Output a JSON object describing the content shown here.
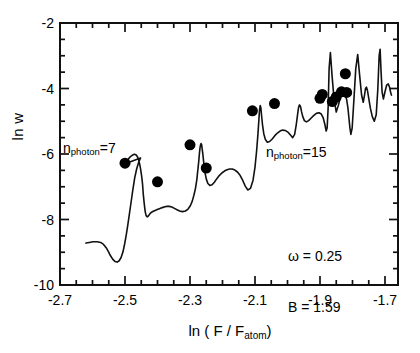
{
  "chart_data": {
    "type": "line",
    "title": "",
    "xlabel": "ln ( F / F_atom )",
    "ylabel": "ln w",
    "xlim": [
      -2.7,
      -1.66
    ],
    "ylim": [
      -10,
      -2
    ],
    "grid": false,
    "legend": "none",
    "xticks": [
      -2.7,
      -2.5,
      -2.3,
      -2.1,
      -1.9,
      -1.7
    ],
    "xtick_labels": [
      "-2.7",
      "-2.5",
      "-2.3",
      "-2.1",
      "-1.9",
      "-1.7"
    ],
    "xminor_step": 0.05,
    "yticks": [
      -2,
      -4,
      -6,
      -8,
      -10
    ],
    "ytick_labels": [
      "-2",
      "-4",
      "-6",
      "-8",
      "-10"
    ],
    "yminor_step": 0.5,
    "series": [
      {
        "name": "theory-curve",
        "style": "solid-line",
        "x": [
          -2.62,
          -2.61,
          -2.598,
          -2.586,
          -2.575,
          -2.566,
          -2.558,
          -2.551,
          -2.545,
          -2.538,
          -2.531,
          -2.524,
          -2.518,
          -2.512,
          -2.506,
          -2.501,
          -2.496,
          -2.491,
          -2.486,
          -2.481,
          -2.476,
          -2.47,
          -2.464,
          -2.458,
          -2.452,
          -2.5,
          -2.493,
          -2.487,
          -2.482,
          -2.478,
          -2.474,
          -2.47,
          -2.467,
          -2.464,
          -2.461,
          -2.458,
          -2.455,
          -2.452,
          -2.449,
          -2.446,
          -2.444,
          -2.441,
          -2.438,
          -2.435,
          -2.432,
          -2.429,
          -2.426,
          -2.423,
          -2.42,
          -2.417,
          -2.413,
          -2.409,
          -2.404,
          -2.399,
          -2.394,
          -2.389,
          -2.383,
          -2.377,
          -2.371,
          -2.364,
          -2.356,
          -2.348,
          -2.34,
          -2.332,
          -2.323,
          -2.314,
          -2.306,
          -2.299,
          -2.293,
          -2.288,
          -2.283,
          -2.279,
          -2.276,
          -2.273,
          -2.271,
          -2.269,
          -2.267,
          -2.266,
          -2.264,
          -2.263,
          -2.261,
          -2.259,
          -2.257,
          -2.254,
          -2.25,
          -2.245,
          -2.239,
          -2.232,
          -2.225,
          -2.218,
          -2.21,
          -2.202,
          -2.194,
          -2.186,
          -2.178,
          -2.17,
          -2.162,
          -2.154,
          -2.146,
          -2.138,
          -2.13,
          -2.122,
          -2.114,
          -2.106,
          -2.1,
          -2.095,
          -2.091,
          -2.088,
          -2.086,
          -2.084,
          -2.082,
          -2.08,
          -2.077,
          -2.073,
          -2.068,
          -2.062,
          -2.055,
          -2.047,
          -2.039,
          -2.031,
          -2.023,
          -2.015,
          -2.007,
          -1.999,
          -1.991,
          -1.984,
          -1.978,
          -1.973,
          -1.969,
          -1.966,
          -1.963,
          -1.96,
          -1.957,
          -1.953,
          -1.948,
          -1.942,
          -1.935,
          -1.927,
          -1.919,
          -1.911,
          -1.903,
          -1.896,
          -1.89,
          -1.885,
          -1.881,
          -1.878,
          -1.875,
          -1.872,
          -1.868,
          -1.863,
          -1.857,
          -1.85,
          -1.843,
          -1.836,
          -1.829,
          -1.823,
          -1.818,
          -1.814,
          -1.811,
          -1.808,
          -1.805,
          -1.801,
          -1.796,
          -1.79,
          -1.784,
          -1.778,
          -1.772,
          -1.767,
          -1.763,
          -1.76,
          -1.757,
          -1.754,
          -1.75,
          -1.745,
          -1.739,
          -1.733,
          -1.727,
          -1.722,
          -1.718,
          -1.715,
          -1.712,
          -1.709,
          -1.705,
          -1.7,
          -1.695,
          -1.69,
          -1.686,
          -1.683,
          -1.681,
          -1.68
        ],
        "y": [
          -8.72,
          -8.7,
          -8.68,
          -8.68,
          -8.7,
          -8.76,
          -8.86,
          -8.98,
          -9.1,
          -9.21,
          -9.28,
          -9.3,
          -9.26,
          -9.16,
          -8.98,
          -8.74,
          -8.46,
          -8.14,
          -7.8,
          -7.45,
          -7.1,
          -6.72,
          -6.45,
          -6.25,
          -6.12,
          -6.3,
          -6.2,
          -6.12,
          -6.07,
          -6.04,
          -6.02,
          -6.01,
          -6.02,
          -6.05,
          -6.1,
          -6.18,
          -6.3,
          -6.46,
          -6.66,
          -6.92,
          -7.2,
          -7.5,
          -7.75,
          -7.88,
          -7.92,
          -7.9,
          -7.86,
          -7.82,
          -7.79,
          -7.77,
          -7.75,
          -7.73,
          -7.71,
          -7.69,
          -7.67,
          -7.65,
          -7.63,
          -7.61,
          -7.6,
          -7.6,
          -7.62,
          -7.66,
          -7.7,
          -7.74,
          -7.76,
          -7.74,
          -7.68,
          -7.58,
          -7.44,
          -7.26,
          -7.04,
          -6.78,
          -6.5,
          -6.22,
          -5.98,
          -5.8,
          -5.7,
          -5.68,
          -5.72,
          -5.82,
          -5.96,
          -6.14,
          -6.34,
          -6.56,
          -6.76,
          -6.9,
          -6.96,
          -6.94,
          -6.86,
          -6.76,
          -6.66,
          -6.58,
          -6.52,
          -6.48,
          -6.46,
          -6.46,
          -6.49,
          -6.55,
          -6.65,
          -6.8,
          -6.98,
          -7.1,
          -7.05,
          -6.8,
          -6.4,
          -5.9,
          -5.4,
          -4.95,
          -4.65,
          -4.52,
          -4.58,
          -4.8,
          -5.1,
          -5.38,
          -5.56,
          -5.64,
          -5.62,
          -5.54,
          -5.44,
          -5.36,
          -5.3,
          -5.27,
          -5.28,
          -5.33,
          -5.42,
          -5.5,
          -5.4,
          -5.1,
          -4.8,
          -4.58,
          -4.5,
          -4.55,
          -4.7,
          -4.86,
          -4.98,
          -5.02,
          -4.98,
          -4.9,
          -4.82,
          -4.76,
          -4.74,
          -4.78,
          -4.9,
          -5.1,
          -5.3,
          -5.2,
          -4.6,
          -3.4,
          -2.9,
          -3.6,
          -4.3,
          -4.72,
          -4.5,
          -4.2,
          -4.1,
          -4.16,
          -4.34,
          -4.6,
          -4.9,
          -5.2,
          -5.4,
          -5.2,
          -4.4,
          -3.4,
          -2.96,
          -3.6,
          -4.2,
          -4.42,
          -4.2,
          -4.0,
          -3.96,
          -4.06,
          -4.3,
          -4.6,
          -4.86,
          -5.0,
          -4.8,
          -4.0,
          -3.0,
          -2.8,
          -3.5,
          -4.1,
          -4.32,
          -4.1,
          -3.9,
          -3.86,
          -3.96,
          -4.1,
          -4.18,
          -4.2
        ]
      },
      {
        "name": "experimental-points",
        "style": "filled-circle",
        "marker_size_px": 11,
        "x": [
          -2.5,
          -2.4,
          -2.3,
          -2.25,
          -2.108,
          -2.04,
          -1.9,
          -1.893,
          -1.862,
          -1.85,
          -1.834,
          -1.822,
          -1.818
        ],
        "y": [
          -6.28,
          -6.85,
          -5.72,
          -6.43,
          -4.68,
          -4.46,
          -4.3,
          -4.18,
          -4.4,
          -4.26,
          -4.1,
          -3.55,
          -4.12
        ]
      }
    ],
    "annotations": [
      {
        "name": "n-photon-low",
        "text_main": "n",
        "text_sub": "photon",
        "text_tail": "=7",
        "x_px": 63,
        "y_px": 140
      },
      {
        "name": "n-photon-high",
        "text_main": "n",
        "text_sub": "photon",
        "text_tail": "=15",
        "x_px": 266,
        "y_px": 144
      }
    ],
    "parameters": {
      "omega_label": "ω = 0.25",
      "b_label": "B = 1.59",
      "x_px": 288,
      "y_px": 214
    }
  }
}
